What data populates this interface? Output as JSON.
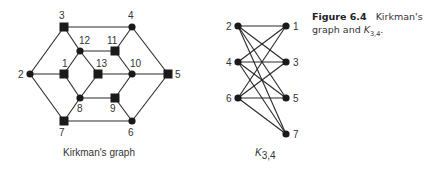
{
  "caption": {
    "figure_label": "Figure 6.4",
    "text_1": "Kirkman's",
    "text_2": "graph and ",
    "k_symbol": "K",
    "k_sub": "3,4",
    "text_end": "."
  },
  "kirkman": {
    "title": "Kirkman's graph",
    "nodes": [
      {
        "id": "1",
        "x": 64,
        "y": 74,
        "shape": "square",
        "lx": -2,
        "ly": -7
      },
      {
        "id": "2",
        "x": 30,
        "y": 74,
        "shape": "circle",
        "lx": -12,
        "ly": 4
      },
      {
        "id": "3",
        "x": 64,
        "y": 27,
        "shape": "square",
        "lx": -5,
        "ly": -8
      },
      {
        "id": "4",
        "x": 132,
        "y": 27,
        "shape": "circle",
        "lx": -4,
        "ly": -8
      },
      {
        "id": "5",
        "x": 168,
        "y": 74,
        "shape": "square",
        "lx": 7,
        "ly": 4
      },
      {
        "id": "6",
        "x": 132,
        "y": 121,
        "shape": "circle",
        "lx": -4,
        "ly": 15
      },
      {
        "id": "7",
        "x": 64,
        "y": 121,
        "shape": "square",
        "lx": -5,
        "ly": 15
      },
      {
        "id": "8",
        "x": 80,
        "y": 98,
        "shape": "circle",
        "lx": -3,
        "ly": 14
      },
      {
        "id": "9",
        "x": 115,
        "y": 98,
        "shape": "square",
        "lx": -5,
        "ly": 14
      },
      {
        "id": "10",
        "x": 132,
        "y": 74,
        "shape": "circle",
        "lx": -2,
        "ly": -7
      },
      {
        "id": "11",
        "x": 115,
        "y": 51,
        "shape": "square",
        "lx": -8,
        "ly": -7
      },
      {
        "id": "12",
        "x": 80,
        "y": 51,
        "shape": "circle",
        "lx": -1,
        "ly": -7
      },
      {
        "id": "13",
        "x": 98,
        "y": 74,
        "shape": "square",
        "lx": -2,
        "ly": -7
      }
    ],
    "edges": [
      [
        "3",
        "4"
      ],
      [
        "3",
        "2"
      ],
      [
        "3",
        "12"
      ],
      [
        "4",
        "11"
      ],
      [
        "4",
        "5"
      ],
      [
        "2",
        "1"
      ],
      [
        "2",
        "7"
      ],
      [
        "12",
        "11"
      ],
      [
        "12",
        "1"
      ],
      [
        "12",
        "13"
      ],
      [
        "11",
        "10"
      ],
      [
        "1",
        "8"
      ],
      [
        "13",
        "10"
      ],
      [
        "13",
        "8"
      ],
      [
        "10",
        "5"
      ],
      [
        "10",
        "9"
      ],
      [
        "8",
        "9"
      ],
      [
        "9",
        "6"
      ],
      [
        "7",
        "8"
      ],
      [
        "7",
        "6"
      ],
      [
        "6",
        "5"
      ]
    ]
  },
  "k34": {
    "title_symbol": "K",
    "title_sub": "3,4",
    "left": [
      {
        "id": "2",
        "x": 238,
        "y": 26
      },
      {
        "id": "4",
        "x": 238,
        "y": 62
      },
      {
        "id": "6",
        "x": 238,
        "y": 98
      }
    ],
    "right": [
      {
        "id": "1",
        "x": 286,
        "y": 26
      },
      {
        "id": "3",
        "x": 286,
        "y": 62
      },
      {
        "id": "5",
        "x": 286,
        "y": 98
      },
      {
        "id": "7",
        "x": 286,
        "y": 134
      }
    ]
  }
}
